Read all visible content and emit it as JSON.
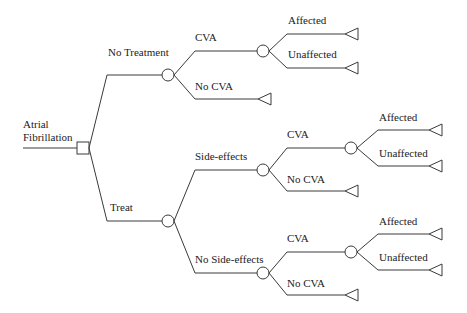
{
  "diagram": {
    "type": "decision-tree",
    "root_label_line1": "Atrial",
    "root_label_line2": "Fibrillation",
    "branches": {
      "no_treatment": {
        "label": "No Treatment",
        "cva": {
          "label": "CVA",
          "affected": "Affected",
          "unaffected": "Unaffected"
        },
        "no_cva": {
          "label": "No CVA"
        }
      },
      "treat": {
        "label": "Treat",
        "side_effects": {
          "label": "Side-effects",
          "cva": {
            "label": "CVA",
            "affected": "Affected",
            "unaffected": "Unaffected"
          },
          "no_cva": {
            "label": "No CVA"
          }
        },
        "no_side_effects": {
          "label": "No Side-effects",
          "cva": {
            "label": "CVA",
            "affected": "Affected",
            "unaffected": "Unaffected"
          },
          "no_cva": {
            "label": "No CVA"
          }
        }
      }
    },
    "legend": {
      "decision_node": "square",
      "chance_node": "circle",
      "terminal_node": "triangle"
    }
  }
}
